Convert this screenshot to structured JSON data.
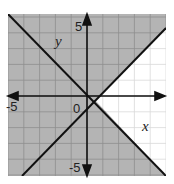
{
  "chart_data": {
    "type": "line",
    "title": "",
    "xlabel": "x",
    "ylabel": "y",
    "xlim": [
      -5,
      5
    ],
    "ylim": [
      -5,
      5
    ],
    "grid": true,
    "tick_labels": {
      "x_neg": "-5",
      "y_pos": "5",
      "y_neg": "-5",
      "origin": "0"
    },
    "series": [
      {
        "name": "boundary line 1",
        "equation": "y = -x",
        "x": [
          -5,
          5
        ],
        "y": [
          5,
          -5
        ]
      },
      {
        "name": "boundary line 2",
        "equation": "y = x - 1",
        "x": [
          -4,
          5
        ],
        "y": [
          -5,
          4
        ]
      }
    ],
    "shaded_region": "all points except the wedge to the right where y > -x and y < x - 1",
    "colors": {
      "shade": "#b4b4b4",
      "grid_shaded": "#8e8e8e",
      "grid_unshaded": "#d9d9d9",
      "line": "#111111"
    }
  }
}
